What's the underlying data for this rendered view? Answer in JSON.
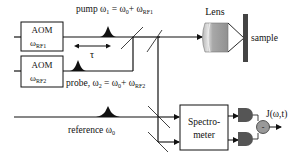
{
  "diagram": {
    "type": "optical-setup",
    "aom1": {
      "title": "AOM",
      "freq_main": "ω",
      "freq_sub": "RF1"
    },
    "aom2": {
      "title": "AOM",
      "freq_main": "ω",
      "freq_sub": "RF2"
    },
    "pump_label": {
      "prefix": "pump ω",
      "sub1": "1",
      "mid": " = ω",
      "sub0": "0",
      "plus": "+ ω",
      "subrf": "RF1"
    },
    "probe_label": {
      "prefix": "probe, ω",
      "sub2": "2",
      "mid": " = ω",
      "sub0": "0",
      "plus": "+ ω",
      "subrf": "RF2"
    },
    "delay_label": "τ",
    "reference_label": {
      "prefix": "reference ω",
      "sub0": "0"
    },
    "lens_label": "Lens",
    "sample_label": "sample",
    "spectrometer_label": {
      "line1": "Spectro-",
      "line2": "meter"
    },
    "subtract_symbol": "-",
    "output_label": "J(ω,t)",
    "colors": {
      "line": "#111111",
      "lens": "#9a9a9a",
      "sample": "#444444",
      "detector": "#555555",
      "subtractor": "#999999"
    }
  }
}
